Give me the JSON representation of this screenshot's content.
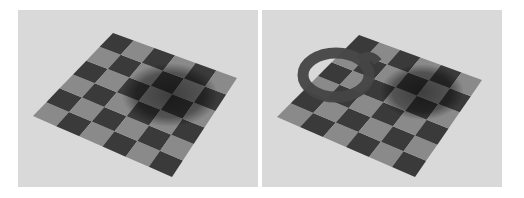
{
  "figure": {
    "panels": [
      {
        "id": "left",
        "description": "Rendered 6x6 checkerboard plane with a diffuse shadow, no occluding object",
        "board_corners": {
          "top": [
            113,
            33
          ],
          "right": [
            237,
            78
          ],
          "bottom": [
            172,
            177
          ],
          "left": [
            33,
            116
          ]
        },
        "has_ring_object": false
      },
      {
        "id": "right",
        "description": "Same checkerboard plane with a dark ring object casting a shadow",
        "board_corners": {
          "top": [
            359,
            35
          ],
          "right": [
            482,
            80
          ],
          "bottom": [
            415,
            177
          ],
          "left": [
            277,
            117
          ]
        },
        "has_ring_object": true
      }
    ],
    "colors": {
      "background": "#d9d9d9",
      "light_square": "#8a8a8a",
      "dark_square": "#3a3a3a",
      "shadow": "#000000",
      "ring": "#4a4a4a"
    },
    "grid_size": 6
  }
}
